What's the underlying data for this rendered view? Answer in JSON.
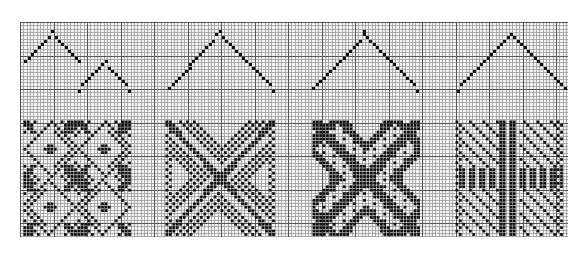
{
  "figure": {
    "title": "",
    "paper": {
      "x": 20,
      "y": 22,
      "width": 548,
      "height": 215,
      "cell_px": 3.35,
      "major_every": 10,
      "background": "#f4f4f4",
      "minor_line_color": "#9a9a9a",
      "major_line_color": "#555555",
      "ink_color": "#111111"
    },
    "threadings": [
      {
        "name": "threading-1a",
        "points": [
          [
            25,
            60
          ],
          [
            51,
            32
          ],
          [
            77,
            60
          ]
        ]
      },
      {
        "name": "threading-1b",
        "points": [
          [
            78,
            89
          ],
          [
            105,
            62
          ],
          [
            130,
            89
          ]
        ]
      },
      {
        "name": "threading-2",
        "points": [
          [
            168,
            86
          ],
          [
            220,
            32
          ],
          [
            273,
            89
          ]
        ]
      },
      {
        "name": "threading-3",
        "points": [
          [
            313,
            86
          ],
          [
            365,
            32
          ],
          [
            418,
            89
          ]
        ]
      },
      {
        "name": "threading-4",
        "points": [
          [
            457,
            89
          ],
          [
            511,
            33
          ],
          [
            563,
            88
          ]
        ]
      }
    ],
    "drawdowns": [
      {
        "name": "drawdown-1",
        "style": "star-diamond",
        "x": 23,
        "y": 120,
        "w": 108,
        "h": 116
      },
      {
        "name": "drawdown-2",
        "style": "x-chevron",
        "x": 165,
        "y": 120,
        "w": 110,
        "h": 116
      },
      {
        "name": "drawdown-3",
        "style": "x-bands",
        "x": 312,
        "y": 120,
        "w": 108,
        "h": 116
      },
      {
        "name": "drawdown-4",
        "style": "speckled-cross",
        "x": 455,
        "y": 120,
        "w": 108,
        "h": 116
      }
    ]
  }
}
